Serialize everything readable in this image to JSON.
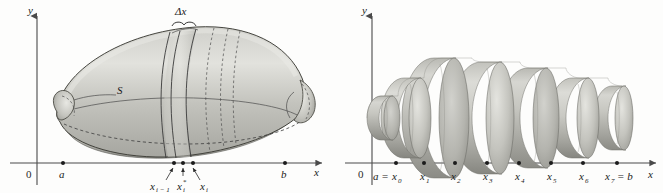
{
  "figure": {
    "title_hidden": "",
    "panels": [
      {
        "id": "left-panel",
        "name": "solid-of-revolution",
        "axes": {
          "y_label": "y",
          "x_label": "x",
          "origin_label": "0"
        },
        "tick_labels": [
          {
            "text": "a",
            "sub": ""
          },
          {
            "text": "b",
            "sub": ""
          }
        ],
        "annotations": [
          {
            "name": "solid-label",
            "text": "S"
          },
          {
            "name": "delta-x-label",
            "text": "Δx"
          },
          {
            "name": "x-left-label",
            "base": "x",
            "sub": "i − 1"
          },
          {
            "name": "x-star-label",
            "base": "x",
            "sub": "i",
            "sup": "*"
          },
          {
            "name": "x-right-label",
            "base": "x",
            "sub": "i"
          }
        ]
      },
      {
        "id": "right-panel",
        "name": "disk-approximation",
        "axes": {
          "y_label": "y",
          "x_label": "x",
          "origin_label": "0"
        },
        "tick_labels": [
          {
            "prefix": "a =",
            "base": "x",
            "sub": "0"
          },
          {
            "prefix": "",
            "base": "x",
            "sub": "1"
          },
          {
            "prefix": "",
            "base": "x",
            "sub": "2"
          },
          {
            "prefix": "",
            "base": "x",
            "sub": "3"
          },
          {
            "prefix": "",
            "base": "x",
            "sub": "4"
          },
          {
            "prefix": "",
            "base": "x",
            "sub": "5"
          },
          {
            "prefix": "",
            "base": "x",
            "sub": "6"
          },
          {
            "prefix": "",
            "base": "x",
            "sub": "7",
            "suffix": "= b"
          }
        ],
        "disk_count": 7,
        "disk_radii_px": [
          22,
          34,
          52,
          56,
          50,
          40,
          28
        ]
      }
    ],
    "colors": {
      "background": "#fdfdfc",
      "axis": "#4a4a4a",
      "ink": "#1a1a1a",
      "surface_light": "#d9d9d4",
      "surface_mid": "#b6b6b0",
      "surface_dark": "#8e8e88",
      "surface_darkest": "#6e6e68"
    }
  }
}
